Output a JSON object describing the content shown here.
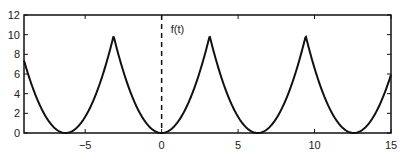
{
  "chart_data": {
    "type": "line",
    "title": "",
    "xlabel": "",
    "ylabel": "",
    "xlim": [
      -9,
      15
    ],
    "ylim": [
      0,
      12
    ],
    "xticks": [
      -5,
      0,
      5,
      10,
      15
    ],
    "yticks": [
      0,
      2,
      4,
      6,
      8,
      10,
      12
    ],
    "grid": false,
    "annotations": [
      {
        "text": "f(t)",
        "x": 0.6,
        "y": 10.2
      }
    ],
    "vertical_line": {
      "x": 0,
      "style": "dashed"
    },
    "series": [
      {
        "name": "f(t)",
        "description": "Periodic extension of t^2 on [-pi, pi], period 2*pi",
        "x": [
          -9,
          -7.5,
          -6.283,
          -5,
          -4,
          -3.1416,
          -2,
          -1,
          0,
          1,
          2,
          3.1416,
          4,
          5,
          6.283,
          7.5,
          8,
          9.4248,
          10,
          11,
          12.566,
          14,
          15
        ],
        "values": [
          7.38,
          1.48,
          0,
          1.65,
          5.21,
          9.87,
          4.0,
          1.0,
          0,
          1.0,
          4.0,
          9.87,
          5.21,
          1.65,
          0,
          1.48,
          2.95,
          9.87,
          7.02,
          2.45,
          0,
          2.06,
          5.93
        ]
      }
    ]
  }
}
